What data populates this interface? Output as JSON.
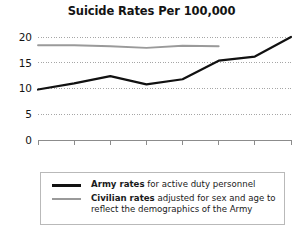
{
  "chart_data": {
    "type": "line",
    "title": "Suicide Rates Per 100,000",
    "xlabel": "",
    "ylabel": "",
    "x": [
      2001,
      2002,
      2003,
      2004,
      2005,
      2006,
      2007,
      2008
    ],
    "categories": [
      "2001",
      "2002",
      "2003",
      "2004",
      "2005",
      "2006",
      "2007",
      "2008"
    ],
    "ylim": [
      0,
      20
    ],
    "yticks": [
      0,
      5,
      10,
      15,
      20
    ],
    "ytick_labels": [
      "0",
      "5",
      "10",
      "15",
      "20"
    ],
    "grid": true,
    "grid_style": "dotted",
    "legend_position": "below-plot",
    "series": [
      {
        "name": "Army rates",
        "color": "#111111",
        "values": [
          9.8,
          11.0,
          12.4,
          10.8,
          11.8,
          15.4,
          16.2,
          20.0
        ]
      },
      {
        "name": "Civilian rates",
        "color": "#9a9a9a",
        "values": [
          18.4,
          18.4,
          18.2,
          17.9,
          18.3,
          18.2,
          null,
          null
        ]
      }
    ]
  },
  "legend": {
    "entries": [
      {
        "swatch_name": "army-line-swatch",
        "bold_text": "Army rates",
        "rest_text": " for active duty personnel"
      },
      {
        "swatch_name": "civilian-line-swatch",
        "bold_text": "Civilian rates",
        "rest_text": " adjusted for sex and age to reflect the demographics of the Army"
      }
    ]
  }
}
